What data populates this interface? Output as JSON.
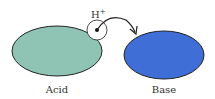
{
  "diagram": {
    "proton_label": "H",
    "proton_charge": "+",
    "acid": {
      "label": "Acid",
      "color": "#8fc4b4"
    },
    "base": {
      "label": "Base",
      "color": "#3f6fd6"
    }
  }
}
